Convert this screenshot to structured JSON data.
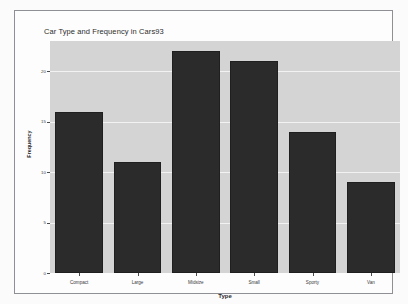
{
  "chart_data": {
    "type": "bar",
    "title": "Car Type and Frequency in Cars93",
    "xlabel": "Type",
    "ylabel": "Frequency",
    "categories": [
      "Compact",
      "Large",
      "Midsize",
      "Small",
      "Sporty",
      "Van"
    ],
    "values": [
      16,
      11,
      22,
      21,
      14,
      9
    ],
    "ylim": [
      0,
      23
    ],
    "yticks": [
      0,
      5,
      10,
      15,
      20
    ],
    "ytick_labels": [
      "0",
      "5",
      "10",
      "15",
      "20"
    ],
    "grid": true,
    "legend": "none",
    "colors": {
      "panel_background": "#d4d4d4",
      "bar_fill": "#2b2b2b",
      "gridline": "#f2f2f2",
      "frame_border": "#8e9095",
      "figure_background": "#fbfbfb",
      "text": "#2d2d2d"
    }
  }
}
